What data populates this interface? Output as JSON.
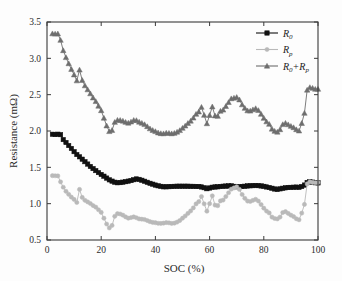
{
  "chart_data": {
    "type": "line",
    "title": "",
    "xlabel": "SOC (%)",
    "ylabel": "Resistance (mΩ)",
    "xlim": [
      0,
      100
    ],
    "ylim": [
      0.5,
      3.5
    ],
    "xticks": [
      0,
      20,
      40,
      60,
      80,
      100
    ],
    "yticks": [
      0.5,
      1.0,
      1.5,
      2.0,
      2.5,
      3.0,
      3.5
    ],
    "xtick_labels": [
      "0",
      "20",
      "40",
      "60",
      "80",
      "100"
    ],
    "ytick_labels": [
      "0.5",
      "1.0",
      "1.5",
      "2.0",
      "2.5",
      "3.0",
      "3.5"
    ],
    "grid": false,
    "legend_position": "top-right",
    "x": [
      2,
      3,
      4,
      5,
      6,
      7,
      8,
      9,
      10,
      11,
      12,
      13,
      14,
      15,
      16,
      17,
      18,
      19,
      20,
      21,
      22,
      23,
      24,
      25,
      26,
      27,
      28,
      29,
      30,
      31,
      32,
      33,
      34,
      35,
      36,
      37,
      38,
      39,
      40,
      41,
      42,
      43,
      44,
      45,
      46,
      47,
      48,
      49,
      50,
      51,
      52,
      53,
      54,
      55,
      56,
      57,
      58,
      59,
      60,
      61,
      62,
      63,
      64,
      65,
      66,
      67,
      68,
      69,
      70,
      71,
      72,
      73,
      74,
      75,
      76,
      77,
      78,
      79,
      80,
      81,
      82,
      83,
      84,
      85,
      86,
      87,
      88,
      89,
      90,
      91,
      92,
      93,
      94,
      95,
      96,
      97,
      98,
      99,
      100
    ],
    "series": [
      {
        "name": "R_0",
        "label": "R0",
        "marker": "square",
        "color": "#111111",
        "values": [
          1.955,
          1.952,
          1.956,
          1.95,
          1.882,
          1.842,
          1.8,
          1.76,
          1.716,
          1.676,
          1.645,
          1.612,
          1.578,
          1.545,
          1.512,
          1.483,
          1.455,
          1.428,
          1.402,
          1.378,
          1.352,
          1.328,
          1.31,
          1.295,
          1.288,
          1.29,
          1.296,
          1.303,
          1.31,
          1.318,
          1.33,
          1.34,
          1.334,
          1.322,
          1.308,
          1.294,
          1.28,
          1.268,
          1.256,
          1.246,
          1.238,
          1.232,
          1.232,
          1.234,
          1.236,
          1.238,
          1.24,
          1.24,
          1.24,
          1.24,
          1.24,
          1.238,
          1.238,
          1.236,
          1.236,
          1.23,
          1.22,
          1.206,
          1.216,
          1.226,
          1.23,
          1.232,
          1.236,
          1.24,
          1.242,
          1.244,
          1.246,
          1.238,
          1.232,
          1.234,
          1.236,
          1.24,
          1.244,
          1.246,
          1.248,
          1.25,
          1.248,
          1.244,
          1.238,
          1.23,
          1.222,
          1.212,
          1.202,
          1.196,
          1.204,
          1.212,
          1.218,
          1.222,
          1.224,
          1.226,
          1.228,
          1.224,
          1.236,
          1.256,
          1.292,
          1.3,
          1.296,
          1.288,
          1.286
        ]
      },
      {
        "name": "R_p",
        "label": "Rp",
        "marker": "circle",
        "color": "#b9b9b9",
        "values": [
          1.385,
          1.384,
          1.382,
          1.3,
          1.226,
          1.17,
          1.128,
          1.09,
          1.058,
          1.016,
          1.196,
          1.086,
          1.046,
          1.024,
          1.002,
          0.974,
          0.952,
          0.916,
          0.88,
          0.8,
          0.72,
          0.666,
          0.7,
          0.826,
          0.862,
          0.858,
          0.842,
          0.818,
          0.8,
          0.808,
          0.818,
          0.806,
          0.79,
          0.786,
          0.782,
          0.768,
          0.752,
          0.742,
          0.738,
          0.73,
          0.728,
          0.732,
          0.74,
          0.736,
          0.728,
          0.732,
          0.746,
          0.768,
          0.8,
          0.83,
          0.866,
          0.9,
          0.942,
          0.996,
          1.028,
          1.098,
          0.998,
          0.896,
          1.0,
          1.108,
          0.98,
          0.972,
          1.038,
          1.05,
          1.098,
          1.15,
          1.2,
          1.216,
          1.232,
          1.196,
          1.126,
          1.074,
          1.036,
          1.03,
          1.046,
          1.06,
          1.036,
          0.988,
          0.938,
          0.898,
          0.872,
          0.816,
          0.796,
          0.79,
          0.816,
          0.878,
          0.89,
          0.866,
          0.842,
          0.822,
          0.792,
          0.778,
          0.87,
          0.99,
          1.272,
          1.3,
          1.294,
          1.288,
          1.29
        ]
      },
      {
        "name": "R_0+R_p",
        "label": "R0+Rp",
        "marker": "triangle",
        "color": "#6e6e6e",
        "values": [
          3.34,
          3.336,
          3.338,
          3.25,
          3.108,
          3.012,
          2.928,
          2.85,
          2.774,
          2.692,
          2.841,
          2.698,
          2.624,
          2.569,
          2.514,
          2.457,
          2.407,
          2.344,
          2.282,
          2.178,
          2.072,
          1.994,
          2.01,
          2.121,
          2.15,
          2.148,
          2.138,
          2.121,
          2.11,
          2.126,
          2.148,
          2.146,
          2.124,
          2.108,
          2.09,
          2.062,
          2.032,
          2.01,
          1.994,
          1.976,
          1.966,
          1.964,
          1.972,
          1.97,
          1.964,
          1.97,
          1.986,
          2.008,
          2.04,
          2.07,
          2.106,
          2.138,
          2.18,
          2.232,
          2.264,
          2.328,
          2.218,
          2.102,
          2.216,
          2.334,
          2.21,
          2.204,
          2.274,
          2.29,
          2.34,
          2.394,
          2.446,
          2.454,
          2.464,
          2.43,
          2.362,
          2.314,
          2.28,
          2.276,
          2.294,
          2.31,
          2.284,
          2.232,
          2.176,
          2.128,
          2.094,
          2.028,
          1.998,
          1.986,
          2.02,
          2.09,
          2.108,
          2.088,
          2.066,
          2.048,
          2.02,
          2.002,
          2.106,
          2.246,
          2.564,
          2.6,
          2.59,
          2.576,
          2.576
        ]
      }
    ],
    "legend": [
      {
        "label_main": "R",
        "label_sub": "0",
        "label_tail": "",
        "color": "#111111",
        "marker": "square"
      },
      {
        "label_main": "R",
        "label_sub": "p",
        "label_tail": "",
        "color": "#b9b9b9",
        "marker": "circle"
      },
      {
        "label_main": "R",
        "label_sub": "0",
        "label_tail": "+R",
        "label_sub2": "p",
        "color": "#6e6e6e",
        "marker": "triangle"
      }
    ]
  }
}
